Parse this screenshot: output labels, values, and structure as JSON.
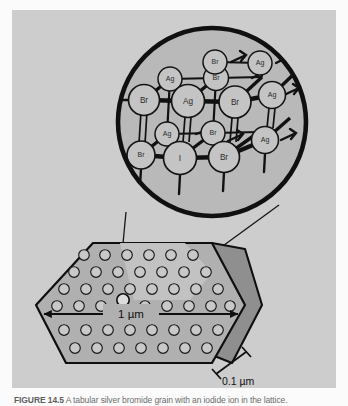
{
  "figure": {
    "caption_label": "FIGURE 14.5",
    "caption_text": " A tabular silver bromide grain with an iodide ion in the lattice.",
    "panel_color": "#cdcdcd",
    "ink_color": "#111111"
  },
  "inset": {
    "name": "magnified-lattice-circle",
    "fill": "#b9b9b9",
    "stroke": "#101010",
    "center_x": 212,
    "center_y": 122,
    "radius": 97,
    "description": "Magnified view of silver bromide crystal lattice containing an iodide ion"
  },
  "lattice": {
    "atom_fill": "#c4c4c4",
    "atom_stroke": "#141414",
    "bond_color": "#111111",
    "atoms": [
      {
        "label": "Br",
        "x": 144,
        "y": 100,
        "r": 15.5,
        "depth": "front"
      },
      {
        "label": "Ag",
        "x": 188,
        "y": 101,
        "r": 16.5,
        "depth": "front"
      },
      {
        "label": "Br",
        "x": 235,
        "y": 102,
        "r": 16.0,
        "depth": "front"
      },
      {
        "label": "Ag",
        "x": 272,
        "y": 95,
        "r": 13.5,
        "depth": "front"
      },
      {
        "label": "Ag",
        "x": 170,
        "y": 79,
        "r": 12.0,
        "depth": "back"
      },
      {
        "label": "Br",
        "x": 216,
        "y": 78,
        "r": 12.5,
        "depth": "back"
      },
      {
        "label": "Br",
        "x": 215,
        "y": 62,
        "r": 12.0,
        "depth": "back"
      },
      {
        "label": "Ag",
        "x": 260,
        "y": 63,
        "r": 12.0,
        "depth": "back"
      },
      {
        "label": "Br",
        "x": 141,
        "y": 155,
        "r": 14.0,
        "depth": "front"
      },
      {
        "label": "I",
        "x": 180,
        "y": 158,
        "r": 16.5,
        "depth": "front"
      },
      {
        "label": "Br",
        "x": 224,
        "y": 157,
        "r": 15.5,
        "depth": "front"
      },
      {
        "label": "Ag",
        "x": 265,
        "y": 140,
        "r": 13.5,
        "depth": "front"
      },
      {
        "label": "Ag",
        "x": 167,
        "y": 134,
        "r": 12.0,
        "depth": "back"
      },
      {
        "label": "Br",
        "x": 213,
        "y": 133,
        "r": 12.0,
        "depth": "back"
      }
    ]
  },
  "crystal": {
    "name": "tabular-grain-hexagon",
    "top_face_fill": "#b0b0b0",
    "side_face_fill": "#8f8f8f",
    "highlight_fill": "#c2c2c2",
    "circle_fill": "#c9c9c9",
    "outline": "#0f0f0f",
    "description": "Hexagonal tabular silver bromide platelet grain"
  },
  "dimensions": {
    "width_label": "1 µm",
    "thickness_label": "0.1 µm"
  }
}
